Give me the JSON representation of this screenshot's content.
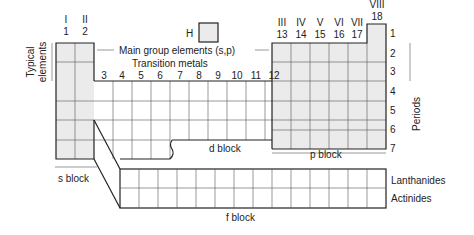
{
  "diagram": {
    "hydrogen_label": "H",
    "roman_groups": [
      "I",
      "II",
      "III",
      "IV",
      "V",
      "VI",
      "VII",
      "VIII"
    ],
    "group_numbers_s": [
      "1",
      "2"
    ],
    "group_numbers_d": [
      "3",
      "4",
      "5",
      "6",
      "7",
      "8",
      "9",
      "10",
      "11",
      "12"
    ],
    "group_numbers_p": [
      "13",
      "14",
      "15",
      "16",
      "17",
      "18"
    ],
    "period_numbers": [
      "1",
      "2",
      "3",
      "4",
      "5",
      "6",
      "7"
    ],
    "labels": {
      "typical_elements_line1": "Typical",
      "typical_elements_line2": "elements",
      "main_group": "Main group elements (s,p)",
      "transition_metals": "Transition metals",
      "periods": "Periods",
      "s_block": "s block",
      "d_block": "d block",
      "p_block": "p block",
      "f_block": "f block",
      "lanthanides": "Lanthanides",
      "actinides": "Actinides"
    },
    "colors": {
      "main_group_shade": "#ebebeb",
      "line": "#222222"
    }
  }
}
